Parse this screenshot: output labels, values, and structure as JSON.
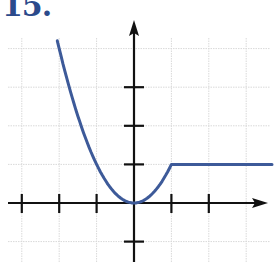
{
  "problem": {
    "number_label": "15."
  },
  "colors": {
    "curve": "#3d5a99",
    "axis": "#111111",
    "grid": "#d9d9d9",
    "label": "#2b4a8b"
  },
  "chart_data": {
    "type": "line",
    "title": "15.",
    "xlabel": "",
    "ylabel": "",
    "grid": true,
    "xlim": [
      -3.1,
      3.5
    ],
    "ylim": [
      -1.5,
      4.7
    ],
    "tick_spacing": 1,
    "x_ticks": [
      -3,
      -2,
      -1,
      1,
      2
    ],
    "y_ticks": [
      -1,
      1,
      2,
      3
    ],
    "series": [
      {
        "name": "f(x)",
        "description": "y = x^2 for x <= 1; y = 1 for x > 1",
        "x": [
          -2.05,
          -2,
          -1.5,
          -1,
          -0.5,
          0,
          0.5,
          1,
          1.5,
          2,
          2.5,
          3,
          3.5
        ],
        "values": [
          4.2,
          4,
          2.25,
          1,
          0.25,
          0,
          0.25,
          1,
          1,
          1,
          1,
          1,
          1
        ]
      }
    ]
  }
}
